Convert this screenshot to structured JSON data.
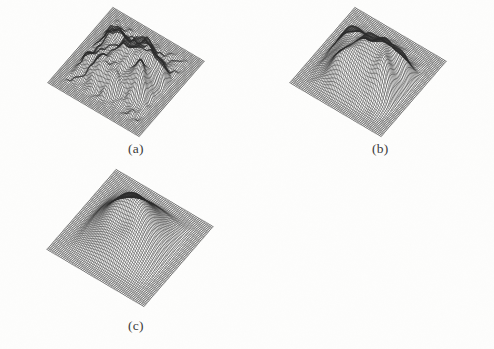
{
  "figure": {
    "kind": "multi-panel-wireframe-surface-figure",
    "background_color": "#fdfdfc",
    "mesh_color": "#2b2b2b",
    "caption_color": "#3a3a3a",
    "panel_count": 3
  },
  "panels": [
    {
      "id": "a",
      "caption": "(a)",
      "caption_x": 128,
      "caption_y": 141,
      "box": {
        "x": 10,
        "y": 6,
        "w": 232,
        "h": 132
      },
      "projection": {
        "rot_x": 0.6,
        "rot_z": 0.62,
        "scale": 1.0
      },
      "grid": {
        "nx": 66,
        "ny": 66
      },
      "surface_type": "rough-noisy-terrain",
      "amplitude": 1.0,
      "bumps": [
        {
          "cx": -0.1,
          "cy": 0.1,
          "sx": 0.42,
          "sy": 0.4,
          "h": 0.62
        },
        {
          "cx": 0.3,
          "cy": -0.05,
          "sx": 0.3,
          "sy": 0.32,
          "h": 0.55
        },
        {
          "cx": -0.48,
          "cy": -0.3,
          "sx": 0.2,
          "sy": 0.22,
          "h": 0.46
        },
        {
          "cx": 0.52,
          "cy": 0.3,
          "sx": 0.16,
          "sy": 0.18,
          "h": 0.66
        },
        {
          "cx": 0.62,
          "cy": -0.18,
          "sx": 0.18,
          "sy": 0.16,
          "h": 0.4
        },
        {
          "cx": -0.28,
          "cy": 0.48,
          "sx": 0.18,
          "sy": 0.15,
          "h": 0.34
        },
        {
          "cx": 0.05,
          "cy": 0.52,
          "sx": 0.14,
          "sy": 0.13,
          "h": 0.3
        },
        {
          "cx": -0.62,
          "cy": 0.3,
          "sx": 0.14,
          "sy": 0.14,
          "h": 0.28
        },
        {
          "cx": 0.18,
          "cy": -0.42,
          "sx": 0.16,
          "sy": 0.15,
          "h": 0.32
        },
        {
          "cx": -0.05,
          "cy": -0.52,
          "sx": 0.13,
          "sy": 0.12,
          "h": 0.24
        }
      ],
      "ripple": {
        "amp": 0.085,
        "freq": 13.0,
        "decay": 2.0
      },
      "noise": {
        "amp": 0.055,
        "freq": 21.0
      },
      "plateau_radius": 0.7,
      "plateau_falloff": 0.16
    },
    {
      "id": "b",
      "caption": "(b)",
      "caption_x": 372,
      "caption_y": 141,
      "box": {
        "x": 252,
        "y": 6,
        "w": 232,
        "h": 132
      },
      "projection": {
        "rot_x": 0.6,
        "rot_z": 0.62,
        "scale": 1.0
      },
      "grid": {
        "nx": 60,
        "ny": 60
      },
      "surface_type": "moderately-smoothed-terrain",
      "amplitude": 1.0,
      "bumps": [
        {
          "cx": -0.06,
          "cy": 0.16,
          "sx": 0.5,
          "sy": 0.46,
          "h": 0.78
        },
        {
          "cx": 0.34,
          "cy": 0.02,
          "sx": 0.34,
          "sy": 0.34,
          "h": 0.58
        },
        {
          "cx": -0.5,
          "cy": -0.22,
          "sx": 0.24,
          "sy": 0.26,
          "h": 0.42
        },
        {
          "cx": 0.55,
          "cy": 0.28,
          "sx": 0.18,
          "sy": 0.2,
          "h": 0.52
        },
        {
          "cx": 0.6,
          "cy": -0.22,
          "sx": 0.22,
          "sy": 0.2,
          "h": 0.4
        },
        {
          "cx": -0.26,
          "cy": 0.46,
          "sx": 0.22,
          "sy": 0.18,
          "h": 0.3
        },
        {
          "cx": 0.1,
          "cy": -0.4,
          "sx": 0.22,
          "sy": 0.2,
          "h": 0.34
        }
      ],
      "ripple": {
        "amp": 0.055,
        "freq": 9.5,
        "decay": 1.7
      },
      "noise": {
        "amp": 0.016,
        "freq": 15.0
      },
      "plateau_radius": 0.72,
      "plateau_falloff": 0.18
    },
    {
      "id": "c",
      "caption": "(c)",
      "caption_x": 128,
      "caption_y": 318,
      "box": {
        "x": 8,
        "y": 168,
        "w": 244,
        "h": 140
      },
      "projection": {
        "rot_x": 0.6,
        "rot_z": 0.62,
        "scale": 1.0
      },
      "grid": {
        "nx": 62,
        "ny": 62
      },
      "surface_type": "heavily-smoothed-dome-with-crater",
      "amplitude": 1.0,
      "bumps": [
        {
          "cx": 0.0,
          "cy": 0.0,
          "sx": 0.52,
          "sy": 0.52,
          "h": 1.0
        }
      ],
      "crater": {
        "cx": -0.02,
        "cy": 0.2,
        "sx": 0.24,
        "sy": 0.2,
        "depth": 0.3
      },
      "ripple": {
        "amp": 0.0,
        "freq": 0.0,
        "decay": 0.0
      },
      "noise": {
        "amp": 0.0,
        "freq": 0.0
      },
      "plateau_radius": 0.62,
      "plateau_falloff": 0.26
    }
  ],
  "chart_data": {
    "type": "surface",
    "title": "",
    "subtitle": "",
    "xlabel": "",
    "ylabel": "",
    "zlabel": "",
    "grid": false,
    "legend_position": "none",
    "panel_labels": [
      "(a)",
      "(b)",
      "(c)"
    ],
    "series": [
      {
        "name": "(a)",
        "note": "original noisy surface, many sharp narrow peaks and high-frequency ripples over a flat base plane",
        "peak_count": 10,
        "relative_roughness": 1.0,
        "max_height": 1.0
      },
      {
        "name": "(b)",
        "note": "partially smoothed surface, fewer and broader peaks, ripples attenuated",
        "peak_count": 7,
        "relative_roughness": 0.45,
        "max_height": 0.95
      },
      {
        "name": "(c)",
        "note": "heavily smoothed surface, a single broad dome with a shallow crater depression at its top",
        "peak_count": 1,
        "relative_roughness": 0.02,
        "max_height": 1.0
      }
    ]
  }
}
